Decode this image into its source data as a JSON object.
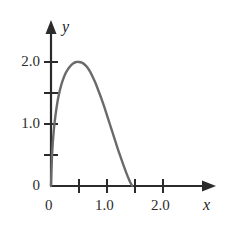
{
  "figure": {
    "background_color": "#ffffff",
    "axis_color": "#2b2b2b",
    "curve_color": "#6a6a6a"
  },
  "axes": {
    "x_axis_name": "x",
    "y_axis_name": "y",
    "origin_label": "0"
  },
  "labels": {
    "y_2_0": "2.0",
    "y_1_0": "1.0",
    "y_0": "0",
    "x_0": "0",
    "x_1_0": "1.0",
    "x_2_0": "2.0"
  },
  "chart_data": {
    "type": "line",
    "title": "",
    "xlabel": "x",
    "ylabel": "y",
    "xlim": [
      0,
      2.45
    ],
    "ylim": [
      0,
      2.35
    ],
    "grid": false,
    "legend": null,
    "x_ticks": [
      0,
      0.5,
      1.0,
      1.5,
      2.0
    ],
    "x_tick_labels": [
      "0",
      "",
      "1.0",
      "",
      "2.0"
    ],
    "y_ticks": [
      0,
      0.5,
      1.0,
      1.5,
      2.0
    ],
    "y_tick_labels": [
      "0",
      "",
      "1.0",
      "",
      "2.0"
    ],
    "series": [
      {
        "name": "curve",
        "color": "#6a6a6a",
        "x": [
          0.0,
          0.02,
          0.05,
          0.08,
          0.12,
          0.16,
          0.2,
          0.25,
          0.3,
          0.35,
          0.4,
          0.45,
          0.5,
          0.55,
          0.6,
          0.65,
          0.7,
          0.75,
          0.8,
          0.85,
          0.9,
          0.95,
          1.0,
          1.05,
          1.1,
          1.15,
          1.2,
          1.25,
          1.3,
          1.35,
          1.4,
          1.45
        ],
        "y": [
          0.0,
          0.52,
          0.9,
          1.14,
          1.38,
          1.55,
          1.68,
          1.8,
          1.88,
          1.94,
          1.98,
          2.0,
          2.0,
          1.99,
          1.96,
          1.91,
          1.84,
          1.75,
          1.65,
          1.53,
          1.41,
          1.28,
          1.14,
          1.0,
          0.86,
          0.72,
          0.58,
          0.45,
          0.32,
          0.2,
          0.09,
          0.0
        ]
      }
    ],
    "annotations": {
      "peak_x": 0.5,
      "peak_y": 2.0,
      "x_intercept": 1.45
    }
  }
}
